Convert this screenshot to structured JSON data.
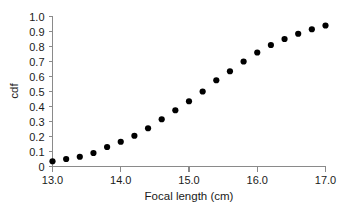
{
  "chart_data": {
    "type": "scatter",
    "title": "",
    "xlabel": "Focal length (cm)",
    "ylabel": "cdf",
    "xlim": [
      13.0,
      17.0
    ],
    "ylim": [
      0.0,
      1.0
    ],
    "grid": false,
    "legend": null,
    "marker": "filled-circle",
    "marker_color": "#000000",
    "xticks": [
      13.0,
      14.0,
      15.0,
      16.0,
      17.0
    ],
    "xtick_labels": [
      "13.0",
      "14.0",
      "15.0",
      "16.0",
      "17.0"
    ],
    "yticks": [
      0.0,
      0.1,
      0.2,
      0.3,
      0.4,
      0.5,
      0.6,
      0.7,
      0.8,
      0.9,
      1.0
    ],
    "ytick_labels": [
      "0",
      "0.1",
      "0.2",
      "0.3",
      "0.4",
      "0.5",
      "0.6",
      "0.7",
      "0.8",
      "0.9",
      "1.0"
    ],
    "x": [
      13.0,
      13.2,
      13.4,
      13.6,
      13.8,
      14.0,
      14.2,
      14.4,
      14.6,
      14.8,
      15.0,
      15.2,
      15.4,
      15.6,
      15.8,
      16.0,
      16.2,
      16.4,
      16.6,
      16.8,
      17.0
    ],
    "values": [
      0.035,
      0.05,
      0.065,
      0.09,
      0.13,
      0.165,
      0.205,
      0.255,
      0.315,
      0.375,
      0.435,
      0.5,
      0.575,
      0.635,
      0.7,
      0.76,
      0.81,
      0.85,
      0.885,
      0.915,
      0.94
    ]
  },
  "axis_colors": {
    "axis": "#8a8a8a",
    "text": "#1a1a1a",
    "marker": "#000000"
  }
}
